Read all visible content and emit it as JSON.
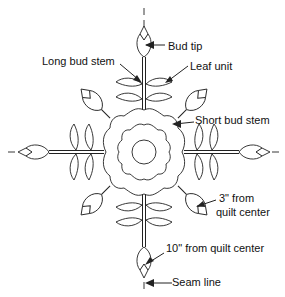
{
  "diagram": {
    "labels": {
      "bud_tip": "Bud tip",
      "long_bud_stem": "Long bud stem",
      "leaf_unit": "Leaf unit",
      "short_bud_stem": "Short bud stem",
      "three_inch_line1": "3\" from",
      "three_inch_line2": "quilt center",
      "ten_inch": "10\" from quilt center",
      "seam_line": "Seam line"
    },
    "colors": {
      "line": "#222222",
      "background": "#ffffff"
    }
  }
}
